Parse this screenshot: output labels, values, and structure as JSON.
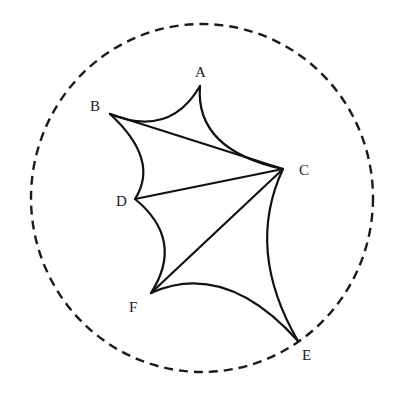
{
  "diagram": {
    "type": "geometry-figure",
    "circle": {
      "style": "dashed",
      "cx": 202,
      "cy": 198,
      "rx": 171,
      "ry": 174
    },
    "points": [
      {
        "id": "A",
        "label": "A",
        "x": 200,
        "y": 86,
        "lx": 195,
        "ly": 77
      },
      {
        "id": "B",
        "label": "B",
        "x": 110,
        "y": 114,
        "lx": 90,
        "ly": 111
      },
      {
        "id": "C",
        "label": "C",
        "x": 283,
        "y": 169,
        "lx": 299,
        "ly": 175
      },
      {
        "id": "D",
        "label": "D",
        "x": 135,
        "y": 199,
        "lx": 116,
        "ly": 206
      },
      {
        "id": "F",
        "label": "F",
        "x": 151,
        "y": 293,
        "lx": 129,
        "ly": 312
      },
      {
        "id": "E",
        "label": "E",
        "x": 298,
        "y": 341,
        "lx": 302,
        "ly": 360
      }
    ],
    "curved_edges": [
      {
        "from": "B",
        "to": "A",
        "path": "M110,114 Q170,138 200,86"
      },
      {
        "from": "A",
        "to": "C",
        "path": "M200,86 Q195,150 283,169"
      },
      {
        "from": "B",
        "to": "D",
        "path": "M110,114 Q160,160 135,199"
      },
      {
        "from": "D",
        "to": "F",
        "path": "M135,199 Q185,240 151,293"
      },
      {
        "from": "C",
        "to": "E",
        "path": "M283,169 Q245,250 298,341"
      },
      {
        "from": "F",
        "to": "E",
        "path": "M151,293 Q225,260 298,341"
      }
    ],
    "straight_edges": [
      {
        "from": "B",
        "to": "C"
      },
      {
        "from": "D",
        "to": "C"
      },
      {
        "from": "F",
        "to": "C"
      }
    ]
  }
}
